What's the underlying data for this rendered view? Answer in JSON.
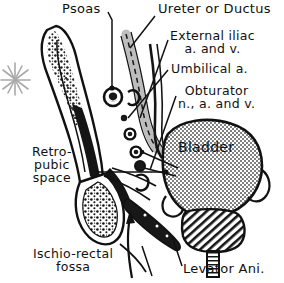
{
  "figure": {
    "background_color": "#ffffff",
    "ink_color": "#111111",
    "accent_gray": "#9a9a9a",
    "fill_gray": "#b8b8b8"
  },
  "labels": {
    "psoas": "Psoas",
    "ureter_or_ductus": "Ureter or Ductus",
    "external_iliac": "External iliac\na. and v.",
    "umbilical_a": "Umbilical a.",
    "obturator": "Obturator\nn., a. and v.",
    "retropubic_space": "Retro-\npubic\nspace",
    "bladder": "Bladder",
    "ischiorectal_fossa": "Ischio-rectal\nfossa",
    "levator_ani": "Levator Ani."
  },
  "structures": [
    {
      "name": "ilium",
      "style": "outlined bone with stippled marrow"
    },
    {
      "name": "pubic-bone",
      "style": "outlined bone with stippled marrow"
    },
    {
      "name": "bladder",
      "style": "stippled gray triangular organ"
    },
    {
      "name": "prostate",
      "style": "diagonal hatched"
    },
    {
      "name": "urethra",
      "style": "cross-hatched tube"
    },
    {
      "name": "levator-ani",
      "style": "dark elongated muscle band"
    },
    {
      "name": "ureter-band",
      "style": "gray dashed band"
    },
    {
      "name": "vessel-cross-sections",
      "style": "small dark circles"
    },
    {
      "name": "asterisk-marker",
      "style": "gray starburst"
    }
  ]
}
